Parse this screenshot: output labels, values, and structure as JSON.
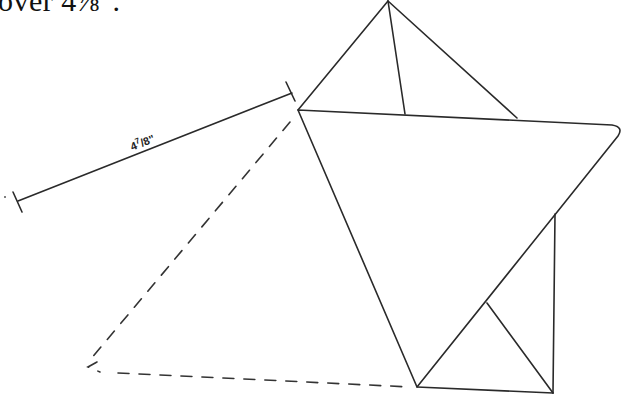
{
  "header_fragment": {
    "text": "over 4⅞\"."
  },
  "diagram": {
    "dimension": {
      "label_whole": "4",
      "label_numerator": "7",
      "label_rest": "/8\"",
      "full_label": "4 7/8\""
    }
  }
}
